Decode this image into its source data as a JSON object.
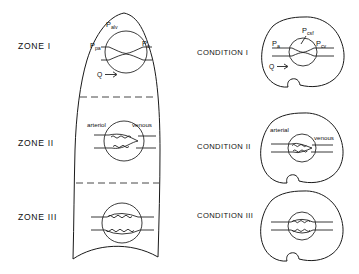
{
  "figure": {
    "background_color": "#ffffff",
    "line_color": "#1a1a1a"
  },
  "left_column": {
    "organ": "lung",
    "zones": [
      {
        "id": "zone-1",
        "label": "ZONE I",
        "vessel_state": "collapsed",
        "annotations": [
          {
            "name": "alveolar-pressure",
            "base": "P",
            "sub": "alv",
            "text": "Palv"
          },
          {
            "name": "pulmonary-arterial-pressure",
            "base": "P",
            "sub": "pa",
            "text": "Ppa"
          },
          {
            "name": "venous-pressure",
            "base": "P",
            "sub": "v",
            "text": "Pv"
          },
          {
            "name": "flow",
            "base": "Q",
            "sub": "",
            "text": "Q"
          }
        ],
        "flow_arrow": "→"
      },
      {
        "id": "zone-2",
        "label": "ZONE II",
        "vessel_state": "partially-collapsed",
        "annotations": [
          {
            "name": "arteriolar-side",
            "base": "arteriol",
            "sub": "",
            "text": "arteriol"
          },
          {
            "name": "venous-side",
            "base": "venous",
            "sub": "",
            "text": "venous"
          }
        ],
        "flow_arrow": ""
      },
      {
        "id": "zone-3",
        "label": "ZONE III",
        "vessel_state": "open",
        "annotations": [],
        "flow_arrow": ""
      }
    ]
  },
  "right_column": {
    "organ": "brain",
    "conditions": [
      {
        "id": "condition-1",
        "label": "CONDITION I",
        "vessel_state": "collapsed",
        "annotations": [
          {
            "name": "arterial-pressure",
            "base": "P",
            "sub": "a",
            "text": "Pa"
          },
          {
            "name": "csf-pressure",
            "base": "P",
            "sub": "csf",
            "text": "Pcsf"
          },
          {
            "name": "cerebral-venous-pressure",
            "base": "P",
            "sub": "cv",
            "text": "Pcv"
          },
          {
            "name": "flow",
            "base": "Q",
            "sub": "",
            "text": "Q"
          }
        ],
        "flow_arrow": "→"
      },
      {
        "id": "condition-2",
        "label": "CONDITION II",
        "vessel_state": "partially-collapsed",
        "annotations": [
          {
            "name": "arterial-side",
            "base": "arterial",
            "sub": "",
            "text": "arterial"
          },
          {
            "name": "venous-side",
            "base": "venous",
            "sub": "",
            "text": "venous"
          }
        ],
        "flow_arrow": ""
      },
      {
        "id": "condition-3",
        "label": "CONDITION III",
        "vessel_state": "open",
        "annotations": [],
        "flow_arrow": ""
      }
    ]
  }
}
